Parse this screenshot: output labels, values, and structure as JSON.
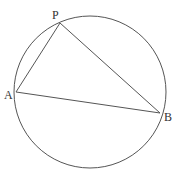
{
  "diagram": {
    "type": "inscribed-triangle",
    "circle": {
      "cx": 90,
      "cy": 92,
      "r": 76
    },
    "stroke_color": "#555555",
    "points": [
      {
        "name": "P",
        "label": "P",
        "x": 60,
        "y": 23,
        "lx": 52,
        "ly": 19
      },
      {
        "name": "A",
        "label": "A",
        "x": 16,
        "y": 92,
        "lx": 4,
        "ly": 99
      },
      {
        "name": "B",
        "label": "B",
        "x": 160,
        "y": 113,
        "lx": 164,
        "ly": 121
      }
    ],
    "segments": [
      [
        "P",
        "A"
      ],
      [
        "P",
        "B"
      ],
      [
        "A",
        "B"
      ]
    ]
  }
}
